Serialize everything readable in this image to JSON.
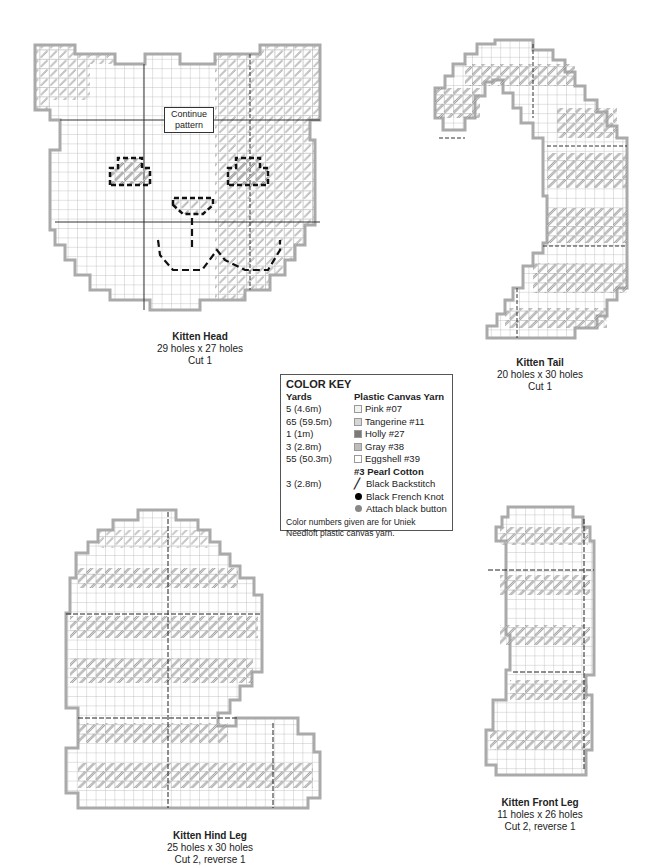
{
  "patterns": [
    {
      "id": "head",
      "title": "Kitten Head",
      "size": "29 holes x 27 holes",
      "cut": "Cut 1",
      "callout": [
        "Continue",
        "pattern"
      ]
    },
    {
      "id": "tail",
      "title": "Kitten Tail",
      "size": "20 holes x 30 holes",
      "cut": "Cut 1"
    },
    {
      "id": "hind_leg",
      "title": "Kitten Hind Leg",
      "size": "25 holes x 30 holes",
      "cut": "Cut 2, reverse 1"
    },
    {
      "id": "front_leg",
      "title": "Kitten Front Leg",
      "size": "11 holes x 26 holes",
      "cut": "Cut 2, reverse 1"
    }
  ],
  "color_key": {
    "title": "COLOR KEY",
    "col_yards": "Yards",
    "col_yarn": "Plastic Canvas Yarn",
    "yarn": [
      {
        "yards": "5 (4.6m)",
        "label": "Pink #07",
        "color": "#f2f2f2"
      },
      {
        "yards": "65 (59.5m)",
        "label": "Tangerine #11",
        "color": "#d6d6d6"
      },
      {
        "yards": "1 (1m)",
        "label": "Holly #27",
        "color": "#7a7a7a"
      },
      {
        "yards": "3 (2.8m)",
        "label": "Gray #38",
        "color": "#bdbdbd"
      },
      {
        "yards": "55 (50.3m)",
        "label": "Eggshell #39",
        "color": "#ffffff"
      }
    ],
    "pearl_header": "#3 Pearl Cotton",
    "pearl": [
      {
        "yards": "3 (2.8m)",
        "label": "Black Backstitch",
        "symbol": "/"
      },
      {
        "yards": "",
        "label": "Black French Knot",
        "symbol": "black-dot"
      },
      {
        "yards": "",
        "label": "Attach black button",
        "symbol": "gray-dot"
      }
    ],
    "note": "Color numbers given are for Uniek Needloft plastic canvas yarn."
  },
  "colors": {
    "grid": "#9a9a9a",
    "outline": "#a8a8a8",
    "stitch": "#8c8c8c",
    "dash": "#111111"
  }
}
